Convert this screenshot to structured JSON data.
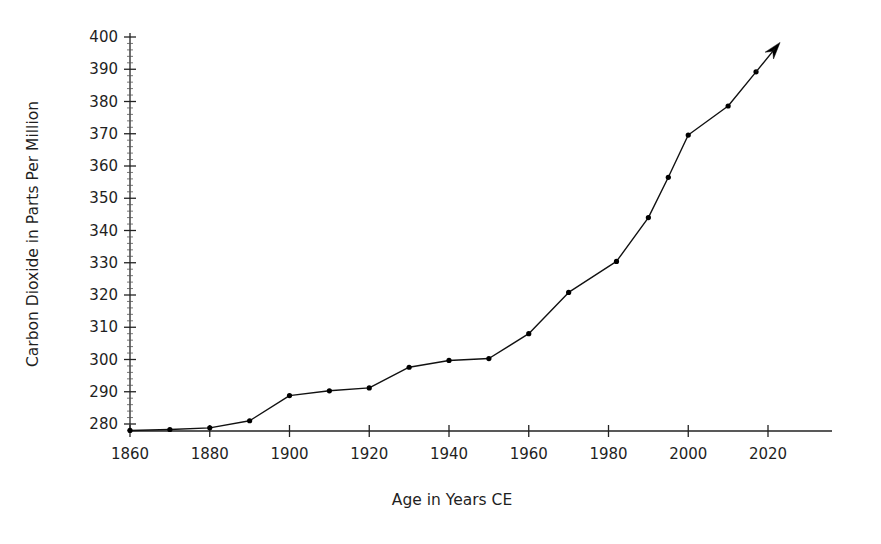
{
  "chart_data": {
    "type": "line",
    "title": "",
    "xlabel": "Age in Years CE",
    "ylabel": "Carbon Dioxide in Parts Per Million",
    "xlim": [
      1860,
      2020
    ],
    "ylim": [
      275,
      400
    ],
    "grid": false,
    "legend": "none",
    "xticks": [
      "1860",
      "1880",
      "1900",
      "1920",
      "1940",
      "1960",
      "1980",
      "2000",
      "2020"
    ],
    "xtick_values": [
      1860,
      1880,
      1900,
      1920,
      1940,
      1960,
      1980,
      2000,
      2020
    ],
    "yticks": [
      "280",
      "290",
      "300",
      "310",
      "320",
      "330",
      "340",
      "350",
      "360",
      "370",
      "380",
      "390",
      "400"
    ],
    "ytick_values": [
      280,
      290,
      300,
      310,
      320,
      330,
      340,
      350,
      360,
      370,
      380,
      390,
      400
    ],
    "x": [
      1860,
      1870,
      1880,
      1890,
      1900,
      1910,
      1920,
      1930,
      1940,
      1950,
      1960,
      1970,
      1982,
      1990,
      1995,
      2000,
      2010,
      2017
    ],
    "values": [
      278.0,
      278.3,
      278.8,
      281.0,
      288.8,
      290.3,
      291.2,
      297.6,
      299.7,
      300.3,
      308.0,
      320.8,
      330.4,
      344.0,
      356.5,
      369.6,
      378.6,
      389.2
    ],
    "series": [
      {
        "name": "Atmospheric CO2",
        "values": [
          278.0,
          278.3,
          278.8,
          281.0,
          288.8,
          290.3,
          291.2,
          297.6,
          299.7,
          300.3,
          308.0,
          320.8,
          330.4,
          344.0,
          356.5,
          369.6,
          378.6,
          389.2
        ]
      }
    ],
    "marker": "dot",
    "line_color": "#111111",
    "marker_color": "#000000",
    "end_arrow": true,
    "annotations": []
  },
  "figure": {
    "background_color": "#ffffff",
    "axis_color": "#222222"
  }
}
